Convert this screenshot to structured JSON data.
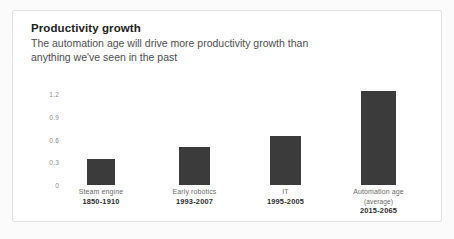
{
  "chart_data": {
    "type": "bar",
    "title": "Productivity growth",
    "subtitle": "The automation age will drive more productivity growth than anything we've seen in the past",
    "categories": [
      "Steam engine",
      "Early robotics",
      "IT",
      "Automation age"
    ],
    "category_notes": [
      "",
      "",
      "",
      "(average)"
    ],
    "period_labels": [
      "1850-1910",
      "1993-2007",
      "1995-2005",
      "2015-2065"
    ],
    "values": [
      0.35,
      0.5,
      0.65,
      1.25
    ],
    "xlabel": "",
    "ylabel": "",
    "ylim": [
      0,
      1.35
    ],
    "yticks": [
      "1.2",
      "0.9",
      "0.6",
      "0.3",
      "0"
    ],
    "ytick_values": [
      1.2,
      0.9,
      0.6,
      0.3,
      0
    ],
    "grid": false,
    "legend": "none",
    "bar_color": "#3b3b3b",
    "background_color": "#ffffff"
  }
}
